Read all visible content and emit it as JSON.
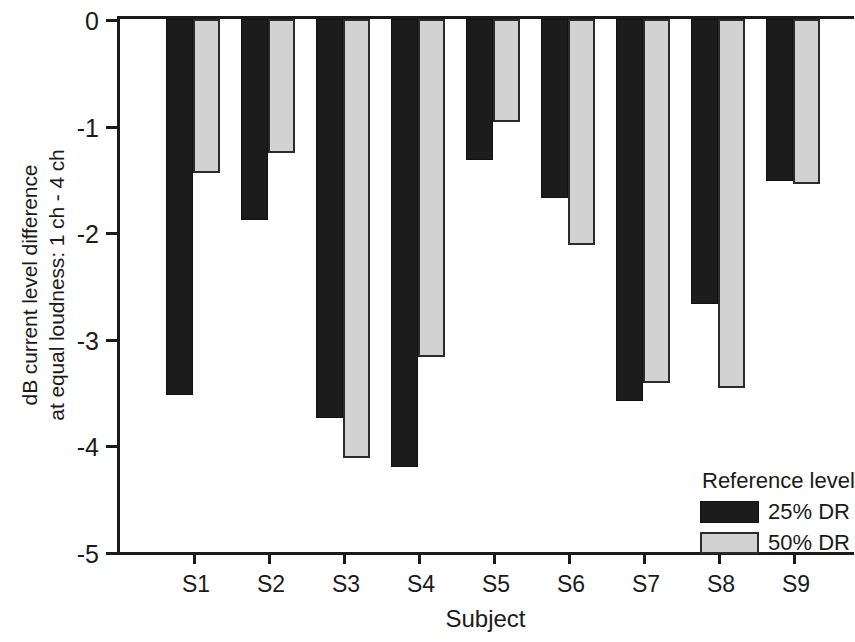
{
  "chart_data": {
    "type": "bar",
    "title": "",
    "subtitle": "",
    "xlabel": "Subject",
    "ylabel_line1": "dB current level difference",
    "ylabel_line2": "at equal loudness: 1 ch - 4 ch",
    "categories": [
      "S1",
      "S2",
      "S3",
      "S4",
      "S5",
      "S6",
      "S7",
      "S8",
      "S9"
    ],
    "series": [
      {
        "name": "25% DR",
        "color": "#1c1c1c",
        "values": [
          -3.53,
          -1.89,
          -3.74,
          -4.2,
          -1.32,
          -1.68,
          -3.58,
          -2.67,
          -1.52
        ]
      },
      {
        "name": "50% DR",
        "color": "#d2d2d2",
        "values": [
          -1.44,
          -1.26,
          -4.12,
          -3.17,
          -0.97,
          -2.12,
          -3.41,
          -3.46,
          -1.55
        ]
      }
    ],
    "ylim": [
      -5,
      0
    ],
    "yticks": [
      0,
      -1,
      -2,
      -3,
      -4,
      -5
    ],
    "ytick_labels": [
      "0",
      "-1",
      "-2",
      "-3",
      "-4",
      "-5"
    ],
    "grid": false,
    "legend_position": "inside-bottom-right",
    "legend_title": "Reference level",
    "legend_entries": [
      "25% DR",
      "50% DR"
    ]
  }
}
